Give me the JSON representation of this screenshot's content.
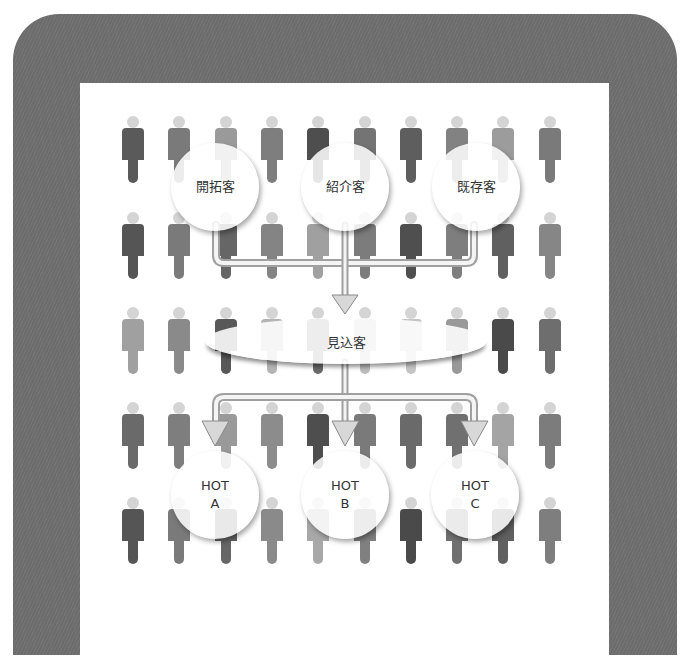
{
  "diagram": {
    "sources": [
      {
        "label": "開拓客",
        "cx": 215,
        "cy": 187
      },
      {
        "label": "紹介客",
        "cx": 345,
        "cy": 187
      },
      {
        "label": "既存客",
        "cx": 476,
        "cy": 187
      }
    ],
    "prospect": {
      "label": "見込客"
    },
    "targets": [
      {
        "line1": "HOT",
        "line2": "A",
        "cx": 215,
        "cy": 495
      },
      {
        "line1": "HOT",
        "line2": "B",
        "cx": 345,
        "cy": 495
      },
      {
        "line1": "HOT",
        "line2": "C",
        "cx": 475,
        "cy": 495
      }
    ]
  },
  "crowd": {
    "columns_x": [
      133,
      179,
      226,
      272,
      318,
      365,
      411,
      457,
      503,
      550
    ],
    "rows_y": [
      116,
      212,
      307,
      402,
      497
    ],
    "tones": [
      [
        "#5a5a5a",
        "#7a7a7a",
        "#9a9a9a",
        "#7e7e7e",
        "#4e4e4e",
        "#747474",
        "#5e5e5e",
        "#828282",
        "#9c9c9c",
        "#7a7a7a"
      ],
      [
        "#555555",
        "#7a7a7a",
        "#666666",
        "#848484",
        "#a0a0a0",
        "#7c7c7c",
        "#4f4f4f",
        "#7e7e7e",
        "#606060",
        "#868686"
      ],
      [
        "#a0a0a0",
        "#8a8a8a",
        "#585858",
        "#b4b4b4",
        "#6a6a6a",
        "#bcbcbc",
        "#c4c4c4",
        "#999999",
        "#4a4a4a",
        "#6e6e6e"
      ],
      [
        "#6a6a6a",
        "#7e7e7e",
        "#9a9a9a",
        "#8c8c8c",
        "#4e4e4e",
        "#7a7a7a",
        "#6a6a6a",
        "#707070",
        "#a4a4a4",
        "#7c7c7c"
      ],
      [
        "#555555",
        "#7a7a7a",
        "#666666",
        "#8a8a8a",
        "#a8a8a8",
        "#808080",
        "#4a4a4a",
        "#707070",
        "#606060",
        "#7e7e7e"
      ]
    ]
  },
  "colors": {
    "frame": "#6c6c6c",
    "pipe_fill": "#f4f4f4",
    "pipe_edge": "#a0a0a0",
    "arrow_fill": "#d8d8d8",
    "arrow_edge": "#8a8a8a",
    "text": "#333333"
  }
}
